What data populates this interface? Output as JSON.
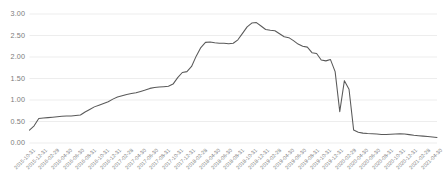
{
  "chart_data": {
    "type": "line",
    "title": "",
    "subtitle": "",
    "xlabel": "",
    "ylabel": "",
    "ylim": [
      0.0,
      3.0
    ],
    "ytick_labels": [
      "0.00",
      "0.50",
      "1.00",
      "1.50",
      "2.00",
      "2.50",
      "3.00"
    ],
    "ytick_values": [
      0.0,
      0.5,
      1.0,
      1.5,
      2.0,
      2.5,
      3.0
    ],
    "grid": true,
    "grid_axis": "y",
    "legend": false,
    "legend_position": "none",
    "line_color": "#595959",
    "grid_color": "#e8e8e8",
    "tick_label_color": "#7b7b7b",
    "background_color": "#ffffff",
    "xtick_labels": [
      "2015-10-31",
      "2015-12-31",
      "2016-02-29",
      "2016-04-30",
      "2016-06-30",
      "2016-08-31",
      "2016-10-31",
      "2016-12-31",
      "2017-02-28",
      "2017-04-30",
      "2017-06-30",
      "2017-08-31",
      "2017-10-31",
      "2017-12-31",
      "2018-02-28",
      "2018-04-30",
      "2018-06-30",
      "2018-08-31",
      "2018-10-31",
      "2018-12-31",
      "2019-02-28",
      "2019-04-30",
      "2019-06-30",
      "2019-08-31",
      "2019-10-31",
      "2019-12-31",
      "2020-02-29",
      "2020-04-30",
      "2020-06-30",
      "2020-08-31",
      "2020-10-31",
      "2020-12-31",
      "2021-02-28",
      "2021-04-30"
    ],
    "x": [
      "2015-10-31",
      "2015-11-30",
      "2015-12-31",
      "2016-01-31",
      "2016-02-29",
      "2016-03-31",
      "2016-04-30",
      "2016-05-31",
      "2016-06-30",
      "2016-07-31",
      "2016-08-31",
      "2016-09-30",
      "2016-10-31",
      "2016-11-30",
      "2016-12-31",
      "2017-01-31",
      "2017-02-28",
      "2017-03-31",
      "2017-04-30",
      "2017-05-31",
      "2017-06-30",
      "2017-07-31",
      "2017-08-31",
      "2017-09-30",
      "2017-10-31",
      "2017-11-30",
      "2017-12-31",
      "2018-01-31",
      "2018-02-28",
      "2018-03-31",
      "2018-04-30",
      "2018-05-31",
      "2018-06-30",
      "2018-07-31",
      "2018-08-31",
      "2018-09-30",
      "2018-10-31",
      "2018-11-30",
      "2018-12-31",
      "2019-01-31",
      "2019-02-28",
      "2019-03-31",
      "2019-04-30",
      "2019-05-31",
      "2019-06-30",
      "2019-07-31",
      "2019-08-31",
      "2019-09-30",
      "2019-10-31",
      "2019-11-30",
      "2019-12-31",
      "2020-01-31",
      "2020-02-29",
      "2020-03-31",
      "2020-04-30",
      "2020-05-31",
      "2020-06-30",
      "2020-07-31",
      "2020-08-31",
      "2020-09-30",
      "2020-10-31",
      "2020-11-30",
      "2020-12-31",
      "2021-01-31",
      "2021-02-28",
      "2021-03-31",
      "2021-04-30"
    ],
    "values": [
      0.3,
      0.4,
      0.57,
      0.58,
      0.59,
      0.6,
      0.61,
      0.62,
      0.63,
      0.63,
      0.64,
      0.65,
      0.72,
      0.78,
      0.84,
      0.88,
      0.92,
      0.96,
      1.02,
      1.07,
      1.1,
      1.13,
      1.15,
      1.17,
      1.2,
      1.23,
      1.27,
      1.29,
      1.3,
      1.31,
      1.32,
      1.37,
      1.52,
      1.64,
      1.66,
      1.78,
      2.02,
      2.22,
      2.34,
      2.35,
      2.33,
      2.32,
      2.32,
      2.31,
      2.32,
      2.4,
      2.55,
      2.7,
      2.79,
      2.8,
      2.72,
      2.64,
      2.62,
      2.61,
      2.54,
      2.47,
      2.45,
      2.38,
      2.3,
      2.25,
      2.23,
      2.1,
      2.08,
      1.93,
      1.91,
      1.94,
      1.66
    ],
    "series_extra_points": [
      {
        "label": "2020-03-15 dip",
        "value": 0.73
      },
      {
        "label": "2020-04-15 spike",
        "value": 1.45
      },
      {
        "label": "2020-05-31 crash",
        "value": 0.25
      },
      {
        "label": "2021-04-30 end",
        "value": 0.13
      }
    ],
    "tail_values": [
      0.73,
      1.45,
      1.25,
      0.3,
      0.25,
      0.23,
      0.22,
      0.215,
      0.21,
      0.2,
      0.2,
      0.205,
      0.21,
      0.215,
      0.21,
      0.195,
      0.18,
      0.17,
      0.16,
      0.15,
      0.14,
      0.13
    ],
    "data_min": 0.13,
    "data_max": 2.8,
    "peak_label": "2019-01-31",
    "peak_value": 2.8,
    "start_label": "2015-10-31",
    "start_value": 0.3,
    "end_label": "2021-04-30",
    "end_value": 0.13
  }
}
